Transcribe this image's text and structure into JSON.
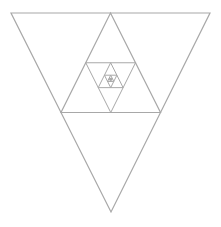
{
  "diagram": {
    "title": "",
    "stroke_color": "#a8a8a8",
    "background": "#ffffff",
    "outer_triangle": {
      "orientation": "down",
      "points": [
        [
          11,
          13
        ],
        [
          210,
          13
        ],
        [
          111,
          212
        ]
      ]
    },
    "levels": 9
  }
}
